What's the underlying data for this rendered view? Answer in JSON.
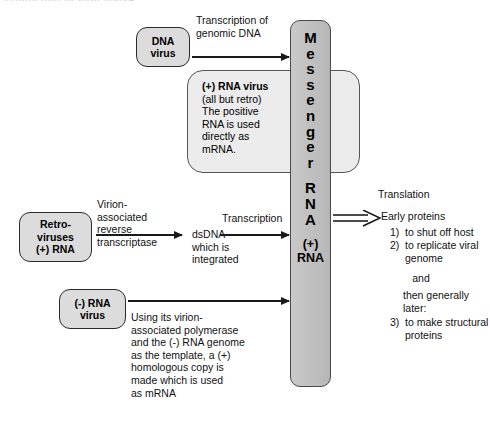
{
  "page": {
    "cut_off_heading": "Production of viral mRNA"
  },
  "boxes": {
    "dna_virus": {
      "line1": "DNA",
      "line2": "virus"
    },
    "retroviruses": {
      "line1": "Retro-",
      "line2": "viruses",
      "line3": "(+) RNA"
    },
    "neg_rna_virus": {
      "line1": "(-) RNA",
      "line2": "virus"
    }
  },
  "notes": {
    "pos_rna": {
      "title": "(+) RNA virus",
      "line1": "(all but retro)",
      "line2": "The positive",
      "line3": "RNA is used",
      "line4": "directly as",
      "line5": "mRNA."
    },
    "neg_rna_mechanism": "Using its virion-\nassociated polymerase\nand the (-) RNA genome\nas the template, a (+)\nhomologous copy is\nmade which is used\nas mRNA"
  },
  "column": {
    "letters": [
      "M",
      "e",
      "s",
      "s",
      "e",
      "n",
      "g",
      "e",
      "r",
      "R",
      "N",
      "A"
    ],
    "footer_line1": "(+)",
    "footer_line2": "RNA"
  },
  "labels": {
    "transcription_genomic_dna": "Transcription of\ngenomic DNA",
    "virion_associated_rt": "Virion-\nassociated\nreverse\ntranscriptase",
    "dsdna_integrated": "dsDNA\nwhich is\nintegrated",
    "transcription": "Transcription",
    "translation": "Translation"
  },
  "proteins": {
    "heading": "Early proteins",
    "items": [
      {
        "num": "1)",
        "text": "to shut off host"
      },
      {
        "num": "2)",
        "text": "to replicate viral\ngenome"
      }
    ],
    "and": "and",
    "later": "then generally later:",
    "item3": {
      "num": "3)",
      "text": "to make structural\nproteins"
    }
  },
  "colors": {
    "box_fill": "#dcdcdc",
    "note_fill": "#ececec",
    "column_fill": "#c2c2c2",
    "stroke": "#2b2b2b",
    "text": "#111111"
  }
}
